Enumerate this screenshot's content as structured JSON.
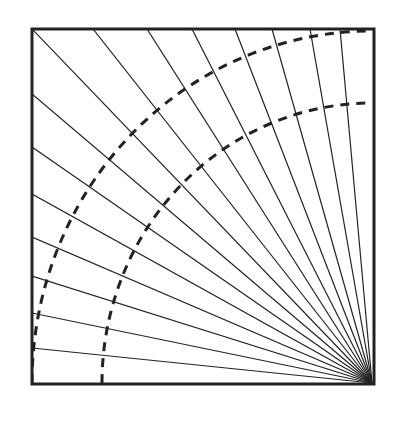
{
  "diagram": {
    "type": "radial-fan-in-square",
    "frame": {
      "x": 32,
      "y": 29,
      "width": 342,
      "height": 355,
      "stroke": "#222222",
      "stroke_width": 3
    },
    "apex": {
      "x": 372,
      "y": 383
    },
    "ray_color": "#222222",
    "ray_width": 1.2,
    "ray_endpoints_top": [
      93,
      147,
      192,
      235,
      272,
      310,
      340
    ],
    "ray_endpoints_left": [
      94,
      147,
      194,
      237,
      276,
      313,
      348
    ],
    "corner_ray": {
      "x": 32,
      "y": 29
    },
    "arcs": [
      {
        "name": "outer-arc",
        "rx": 340,
        "ry": 352,
        "dash": "9 7",
        "stroke_width": 3
      },
      {
        "name": "inner-arc",
        "rx": 270,
        "ry": 280,
        "dash": "9 7",
        "stroke_width": 3
      }
    ]
  }
}
